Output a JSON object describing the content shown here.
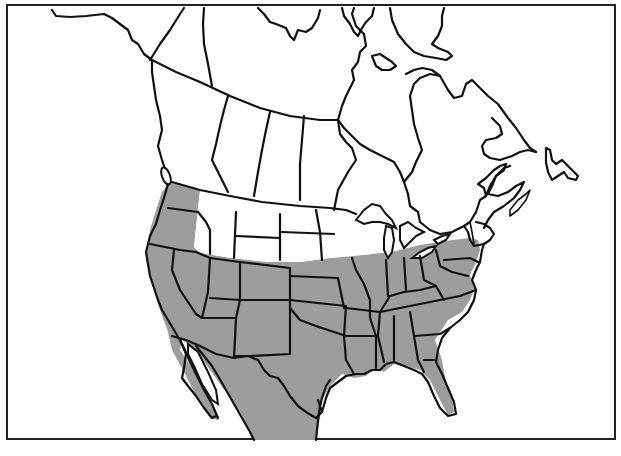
{
  "map": {
    "title": "Range map of North America",
    "description": "Shaded range covering the western, central, southern and eastern United States and northern Mexico",
    "colors": {
      "range_fill": "#9d9d9d",
      "border": "#111111",
      "background": "#ffffff"
    },
    "regions_shaded": [
      "Washington",
      "Oregon",
      "California",
      "Nevada",
      "Utah",
      "Arizona",
      "Colorado",
      "New Mexico",
      "Texas",
      "Oklahoma",
      "Kansas",
      "Nebraska (south)",
      "Iowa",
      "Missouri",
      "Arkansas",
      "Louisiana",
      "Illinois",
      "Indiana",
      "Ohio",
      "Kentucky",
      "Tennessee",
      "Mississippi",
      "Alabama",
      "Georgia",
      "Florida",
      "South Carolina",
      "North Carolina",
      "Virginia",
      "West Virginia",
      "Pennsylvania",
      "New York (south)",
      "Northern Mexico",
      "Baja California"
    ],
    "regions_unshaded": [
      "Alaska (partial)",
      "Canada",
      "Idaho",
      "Montana",
      "Wyoming (north)",
      "North Dakota",
      "South Dakota",
      "Minnesota",
      "Wisconsin",
      "Michigan",
      "New England"
    ]
  }
}
